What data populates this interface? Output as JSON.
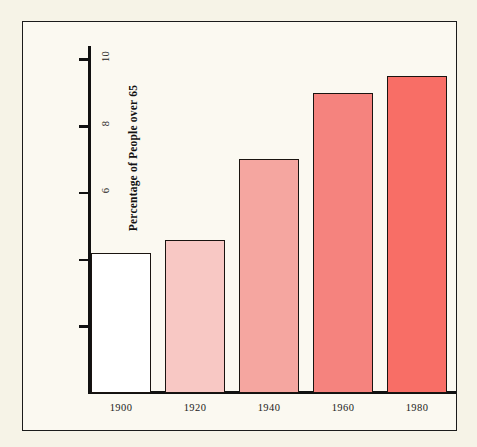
{
  "figure": {
    "background_color": "#f6f3e7",
    "panel_color": "#fbf9f1",
    "frame_color": "#1b1b1b"
  },
  "chart_data": {
    "type": "bar",
    "title": "",
    "xlabel": "",
    "ylabel": "Percentage of People over 65",
    "categories": [
      "1900",
      "1920",
      "1940",
      "1960",
      "1980"
    ],
    "values": [
      4.2,
      4.6,
      7.0,
      9.0,
      9.5
    ],
    "ylim": [
      0,
      10.4
    ],
    "y_ticks": [
      2,
      4,
      6,
      8,
      10
    ],
    "y_tick_labels": [
      "2",
      "4",
      "6",
      "8",
      "10"
    ],
    "x_tick_labels": [
      "1900",
      "1920",
      "1940",
      "1960",
      "1980"
    ],
    "grid": false,
    "legend": null,
    "bar_colors": [
      "#ffffff",
      "#f8c8c4",
      "#f5a6a0",
      "#f5837e",
      "#f86e66"
    ],
    "bar_edge_color": "#1a1410",
    "series": [
      {
        "name": "Percentage of People over 65",
        "values": [
          4.2,
          4.6,
          7.0,
          9.0,
          9.5
        ]
      }
    ],
    "points": [
      {
        "category": "1900",
        "value": 4.2,
        "color": "#ffffff"
      },
      {
        "category": "1920",
        "value": 4.6,
        "color": "#f8c8c4"
      },
      {
        "category": "1940",
        "value": 7.0,
        "color": "#f5a6a0"
      },
      {
        "category": "1960",
        "value": 9.0,
        "color": "#f5837e"
      },
      {
        "category": "1980",
        "value": 9.5,
        "color": "#f86e66"
      }
    ]
  }
}
